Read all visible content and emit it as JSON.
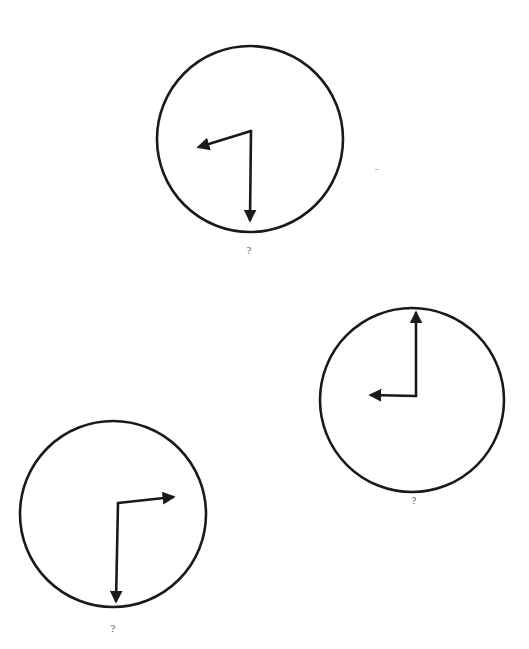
{
  "figure": {
    "width": 529,
    "height": 649,
    "background": "#ffffff",
    "stroke_color": "#1a1a1a"
  },
  "clocks": [
    {
      "id": "clock-top",
      "center": [
        250,
        139
      ],
      "radius": 93,
      "hour_hand": {
        "from": [
          251,
          131
        ],
        "to": [
          199,
          147
        ]
      },
      "minute_hand": {
        "from": [
          251,
          131
        ],
        "to": [
          250,
          220
        ]
      },
      "label": "?",
      "label_pos": [
        249,
        247
      ]
    },
    {
      "id": "clock-right",
      "center": [
        412,
        400
      ],
      "radius": 92,
      "hour_hand": {
        "from": [
          416,
          396
        ],
        "to": [
          371,
          395
        ]
      },
      "minute_hand": {
        "from": [
          416,
          396
        ],
        "to": [
          416,
          313
        ]
      },
      "label": "?",
      "label_pos": [
        414,
        497
      ]
    },
    {
      "id": "clock-bottom-left",
      "center": [
        113,
        514
      ],
      "radius": 93,
      "hour_hand": {
        "from": [
          118,
          503
        ],
        "to": [
          173,
          497
        ]
      },
      "minute_hand": {
        "from": [
          118,
          503
        ],
        "to": [
          116,
          601
        ]
      },
      "label": "?",
      "label_pos": [
        113,
        625
      ]
    }
  ]
}
